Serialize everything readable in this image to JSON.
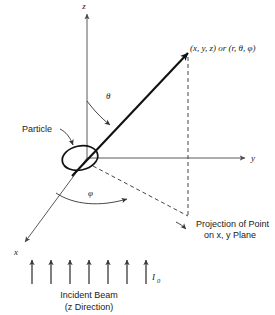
{
  "figure": {
    "background_color": "#ffffff",
    "ink_color": "#1a1a1a"
  },
  "axes": [
    {
      "id": "z",
      "label": "z",
      "direction": "up"
    },
    {
      "id": "y",
      "label": "y",
      "direction": "right"
    },
    {
      "id": "x",
      "label": "x",
      "direction": "lower-left"
    }
  ],
  "point": {
    "label": "(x, y, z) or (r, θ, φ)"
  },
  "angles": [
    {
      "id": "theta",
      "label": "θ",
      "between": "z-axis and r-vector"
    },
    {
      "id": "phi",
      "label": "φ",
      "between": "x-axis and projection"
    }
  ],
  "annotations": {
    "particle": "Particle",
    "projection_line1": "Projection of Point",
    "projection_line2": "on x, y Plane"
  },
  "beam": {
    "intensity_symbol": "I",
    "intensity_subscript": "0",
    "caption_line1": "Incident Beam",
    "caption_line2": "(z Direction)",
    "arrow_count": 7
  }
}
